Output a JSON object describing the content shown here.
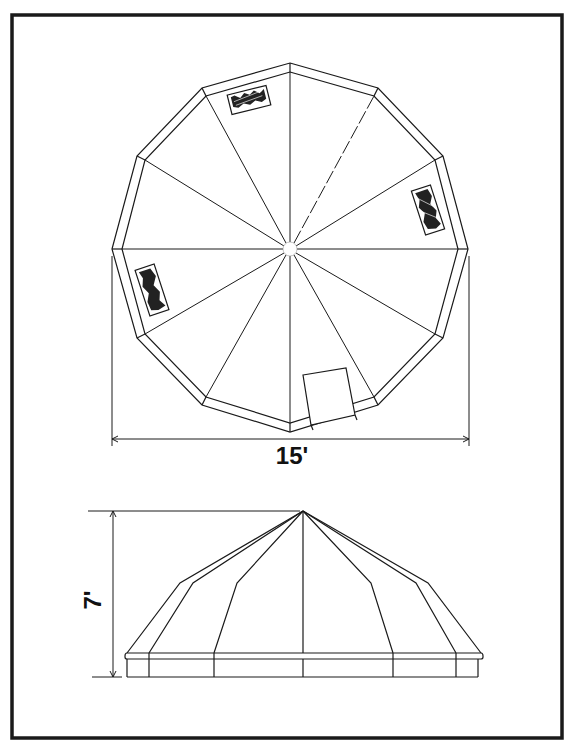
{
  "diagram": {
    "colors": {
      "ink": "#1a1a1a",
      "background": "#ffffff",
      "window_fill": "#222222"
    },
    "plan_view": {
      "name": "top plan view",
      "sides": 12,
      "width_label": "15'",
      "features": [
        "central hub",
        "12 radial ribs",
        "3 skylight windows",
        "door panel"
      ]
    },
    "elevation_view": {
      "name": "side elevation view",
      "height_label": "7'",
      "features": [
        "apex",
        "faceted roof panels",
        "base ring"
      ]
    }
  }
}
